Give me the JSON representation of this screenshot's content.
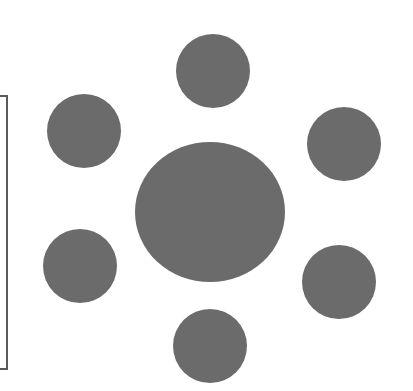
{
  "diagram": {
    "background": "#ffffff",
    "fill_color": "#6b6b6b",
    "stroke_color": "#5a5a5a",
    "bracket": {
      "x": 0,
      "y": 95,
      "width": 8,
      "height": 275
    },
    "center_node": {
      "cx": 210,
      "cy": 212,
      "rx": 75,
      "ry": 70
    },
    "satellite_nodes": [
      {
        "name": "top",
        "cx": 213,
        "cy": 71,
        "r": 37
      },
      {
        "name": "upper-left",
        "cx": 84,
        "cy": 131,
        "r": 37
      },
      {
        "name": "upper-right",
        "cx": 344,
        "cy": 144,
        "r": 37
      },
      {
        "name": "lower-left",
        "cx": 80,
        "cy": 266,
        "r": 37
      },
      {
        "name": "lower-right",
        "cx": 339,
        "cy": 282,
        "r": 37
      },
      {
        "name": "bottom",
        "cx": 210,
        "cy": 346,
        "r": 37
      }
    ]
  }
}
